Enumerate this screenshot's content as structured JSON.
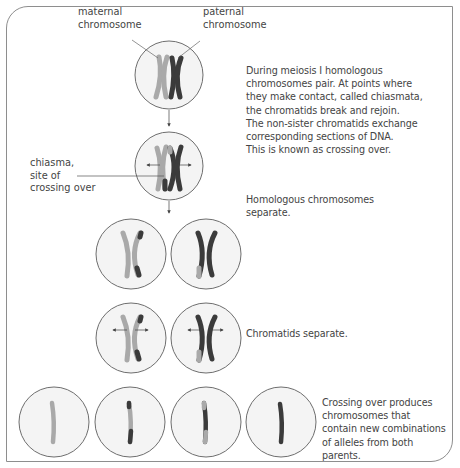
{
  "figure": {
    "labels": {
      "maternal": "maternal\nchromosome",
      "paternal": "paternal\nchromosome",
      "chiasma": "chiasma,\nsite of\ncrossing over"
    },
    "steps": [
      {
        "id": "pairing",
        "text": "During meiosis I homologous\nchromosomes pair. At points where\nthey make contact, called chiasmata,\nthe chromatids break and rejoin.\nThe non-sister chromatids exchange\ncorresponding sections of DNA.\nThis is known as crossing over."
      },
      {
        "id": "homologs-separate",
        "text": "Homologous chromosomes\nseparate."
      },
      {
        "id": "chromatids-separate",
        "text": "Chromatids separate."
      },
      {
        "id": "result",
        "text": "Crossing over produces\nchromosomes that\ncontain new combinations\nof alleles from both\nparents."
      }
    ],
    "colors": {
      "maternal": "#a9a9a9",
      "paternal": "#3b3b3b",
      "cell_fill": "#f4f4f4",
      "cell_stroke": "#6e6e6e",
      "frame": "#8e8e8e"
    }
  }
}
